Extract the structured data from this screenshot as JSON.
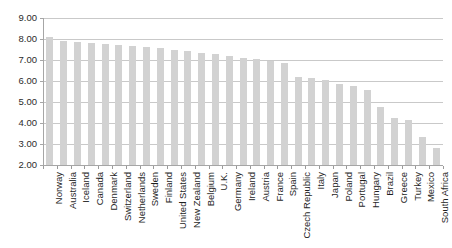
{
  "chart_data": {
    "type": "bar",
    "title": "",
    "subtitle": "",
    "xlabel": "",
    "ylabel": "",
    "grid": "horizontal",
    "legend": "none",
    "ylim": [
      2.0,
      9.0
    ],
    "ytick_step": 1.0,
    "ytick_labels": [
      "9.00",
      "8.00",
      "7.00",
      "6.00",
      "5.00",
      "4.00",
      "3.00",
      "2.00"
    ],
    "ytick_values": [
      9.0,
      8.0,
      7.0,
      6.0,
      5.0,
      4.0,
      3.0,
      2.0
    ],
    "bar_color": "#d2d2d2",
    "gridline_color": "#c9c9c9",
    "axis_color": "#a6a6a6",
    "categories": [
      "Norway",
      "Australia",
      "Iceland",
      "Canada",
      "Denmark",
      "Switzerland",
      "Netherlands",
      "Sweden",
      "Finland",
      "United States",
      "New Zealand",
      "Belgium",
      "U.K.",
      "Germany",
      "Ireland",
      "Austria",
      "France",
      "Spain",
      "Czech Republic",
      "Italy",
      "Japan",
      "Poland",
      "Portugal",
      "Hungary",
      "Brazil",
      "Greece",
      "Turkey",
      "Mexico",
      "South Africa"
    ],
    "values": [
      8.1,
      7.9,
      7.85,
      7.8,
      7.75,
      7.7,
      7.65,
      7.6,
      7.55,
      7.5,
      7.45,
      7.35,
      7.3,
      7.2,
      7.1,
      7.05,
      6.95,
      6.85,
      6.2,
      6.15,
      6.05,
      5.85,
      5.75,
      5.55,
      4.75,
      4.25,
      4.15,
      3.35,
      2.8
    ]
  }
}
